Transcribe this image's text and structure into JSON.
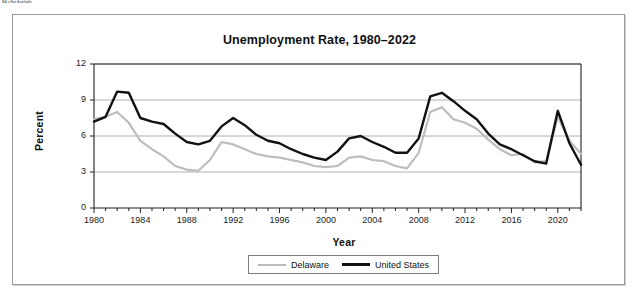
{
  "page": {
    "footnote": "NA = Not Available"
  },
  "chart_data": {
    "type": "line",
    "title": "Unemployment Rate, 1980–2022",
    "xlabel": "Year",
    "ylabel": "Percent",
    "xlim": [
      1980,
      2022
    ],
    "ylim": [
      0,
      12
    ],
    "yticks": [
      0,
      3,
      6,
      9,
      12
    ],
    "xticks": [
      1980,
      1984,
      1988,
      1992,
      1996,
      2000,
      2004,
      2008,
      2012,
      2016,
      2020
    ],
    "grid": "horizontal",
    "legend_position": "bottom-center",
    "x": [
      1980,
      1981,
      1982,
      1983,
      1984,
      1985,
      1986,
      1987,
      1988,
      1989,
      1990,
      1991,
      1992,
      1993,
      1994,
      1995,
      1996,
      1997,
      1998,
      1999,
      2000,
      2001,
      2002,
      2003,
      2004,
      2005,
      2006,
      2007,
      2008,
      2009,
      2010,
      2011,
      2012,
      2013,
      2014,
      2015,
      2016,
      2017,
      2018,
      2019,
      2020,
      2021,
      2022
    ],
    "series": [
      {
        "name": "Delaware",
        "color": "#bdbdbd",
        "values": [
          7.4,
          7.6,
          8.0,
          7.1,
          5.6,
          4.9,
          4.3,
          3.5,
          3.2,
          3.1,
          4.0,
          5.5,
          5.3,
          4.9,
          4.5,
          4.3,
          4.2,
          4.0,
          3.8,
          3.5,
          3.4,
          3.5,
          4.2,
          4.3,
          4.0,
          3.9,
          3.5,
          3.3,
          4.6,
          8.0,
          8.4,
          7.4,
          7.1,
          6.6,
          5.7,
          4.9,
          4.4,
          4.5,
          3.8,
          3.9,
          7.6,
          5.6,
          4.5
        ]
      },
      {
        "name": "United States",
        "color": "#111111",
        "values": [
          7.2,
          7.6,
          9.7,
          9.6,
          7.5,
          7.2,
          7.0,
          6.2,
          5.5,
          5.3,
          5.6,
          6.8,
          7.5,
          6.9,
          6.1,
          5.6,
          5.4,
          4.9,
          4.5,
          4.2,
          4.0,
          4.7,
          5.8,
          6.0,
          5.5,
          5.1,
          4.6,
          4.6,
          5.8,
          9.3,
          9.6,
          8.9,
          8.1,
          7.4,
          6.2,
          5.3,
          4.9,
          4.4,
          3.9,
          3.7,
          8.1,
          5.4,
          3.6
        ]
      }
    ]
  }
}
